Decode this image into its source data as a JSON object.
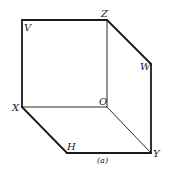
{
  "diagram": {
    "caption": "(a)",
    "type": "isometric-cube-projection",
    "vertices": {
      "V": {
        "label": "V",
        "x": 22,
        "y": 20
      },
      "Z": {
        "label": "Z",
        "x": 107,
        "y": 20
      },
      "W": {
        "label": "W",
        "x": 151,
        "y": 64
      },
      "X": {
        "label": "X",
        "x": 22,
        "y": 107
      },
      "O": {
        "label": "O",
        "x": 107,
        "y": 107
      },
      "H": {
        "label": "H",
        "x": 67,
        "y": 153
      },
      "Y": {
        "label": "Y",
        "x": 151,
        "y": 153
      }
    },
    "edges_outer": [
      [
        "V",
        "Z"
      ],
      [
        "Z",
        "W"
      ],
      [
        "W",
        "Y"
      ],
      [
        "Y",
        "H"
      ],
      [
        "H",
        "X"
      ],
      [
        "X",
        "V"
      ]
    ],
    "edges_inner": [
      [
        "X",
        "O"
      ],
      [
        "Z",
        "O"
      ],
      [
        "O",
        "Y"
      ]
    ],
    "colors": {
      "line": "#1a1a1a",
      "background": "#ffffff"
    }
  }
}
